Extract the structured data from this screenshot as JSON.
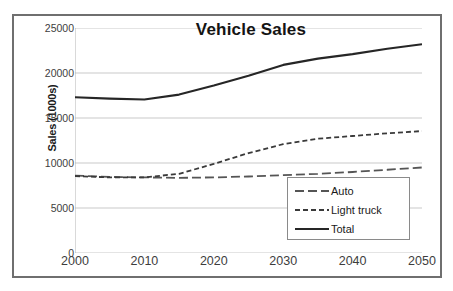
{
  "chart_data": {
    "type": "line",
    "title": "Vehicle Sales",
    "xlabel": "",
    "ylabel": "Sales (1000s)",
    "xlim": [
      2000,
      2050
    ],
    "ylim": [
      0,
      25000
    ],
    "grid": true,
    "legend_position": "bottom-right",
    "x": [
      2000,
      2005,
      2010,
      2015,
      2020,
      2025,
      2030,
      2035,
      2040,
      2045,
      2050
    ],
    "xticks": [
      "2000",
      "2010",
      "2020",
      "2030",
      "2040",
      "2050"
    ],
    "xtick_values": [
      2000,
      2010,
      2020,
      2030,
      2040,
      2050
    ],
    "yticks": [
      "0",
      "5000",
      "10000",
      "15000",
      "20000",
      "25000"
    ],
    "ytick_values": [
      0,
      5000,
      10000,
      15000,
      20000,
      25000
    ],
    "series": [
      {
        "name": "Auto",
        "style": "long-dash",
        "color": "#555555",
        "values": [
          8600,
          8450,
          8400,
          8350,
          8400,
          8500,
          8650,
          8800,
          9000,
          9250,
          9500
        ]
      },
      {
        "name": "Light truck",
        "style": "short-dash",
        "color": "#3a3a3a",
        "values": [
          8550,
          8400,
          8400,
          8800,
          9900,
          11100,
          12100,
          12700,
          13000,
          13300,
          13550
        ]
      },
      {
        "name": "Total",
        "style": "solid",
        "color": "#262626",
        "values": [
          17300,
          17150,
          17050,
          17600,
          18600,
          19700,
          20900,
          21600,
          22100,
          22700,
          23200
        ]
      }
    ]
  },
  "legend": {
    "items": [
      {
        "label": "Auto"
      },
      {
        "label": "Light truck"
      },
      {
        "label": "Total"
      }
    ]
  }
}
